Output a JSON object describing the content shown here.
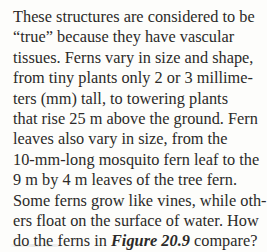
{
  "document": {
    "type": "scanned-textbook-paragraph",
    "background_color": "#fdfdfb",
    "text_color": "#2b2a28",
    "body_text": "These structures are considered to be “true” because they have vascular tissues. Ferns vary in size and shape, from tiny plants only 2 or 3 millimeters (mm) tall, to towering plants that rise 25 m above the ground. Fern leaves also vary in size, from the 10-mm-long mosquito fern leaf to the 9 m by 4 m leaves of the tree fern. Some ferns grow like vines, while others float on the surface of water. How do the ferns in Figure 20.9 compare?",
    "lines": [
      {
        "text": "These structures are considered to be"
      },
      {
        "text": "“true” because they have vascular"
      },
      {
        "text": "tissues. Ferns vary in size and shape,"
      },
      {
        "text": "from tiny plants only 2 or 3 millime-"
      },
      {
        "text": "ters (mm) tall, to towering plants"
      },
      {
        "text": "that rise 25 m above the ground. Fern"
      },
      {
        "text": "leaves also vary in size, from the"
      },
      {
        "text": "10-mm-long mosquito fern leaf to the"
      },
      {
        "text": "9 m by 4 m leaves of the tree fern."
      },
      {
        "text": "Some ferns grow like vines, while oth-"
      },
      {
        "text": "ers float on the surface of water. How"
      }
    ],
    "last_line": {
      "before_reference": "do the ferns in ",
      "figure_reference": "Figure 20.9",
      "after_reference": " compare?"
    }
  }
}
